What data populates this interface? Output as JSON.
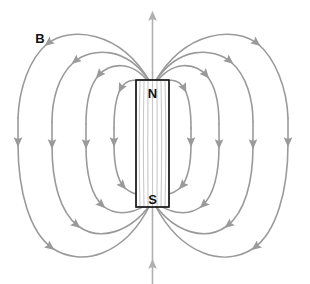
{
  "diagram": {
    "type": "physics-field-line-diagram",
    "background_color": "#ffffff",
    "field_line_color": "#9a9a9a",
    "inner_line_color": "#c9c9c9",
    "magnet_stroke_color": "#1a1a1a",
    "magnet_fill_color": "#ffffff",
    "label_color": "#111111",
    "labels": {
      "field_symbol": "B",
      "north_pole": "N",
      "south_pole": "S"
    },
    "magnet": {
      "x": 136,
      "y": 80,
      "width": 33,
      "height": 127,
      "north_label_y": 93,
      "south_label_y": 200
    },
    "axis": {
      "x": 152.5,
      "top_y": 8,
      "bottom_y": 276,
      "arrow_direction": "up",
      "arrow_count": 2
    },
    "loops": [
      {
        "name": "loop-1-innermost",
        "half_width": 38,
        "half_height": 46
      },
      {
        "name": "loop-2",
        "half_width": 66,
        "half_height": 72
      },
      {
        "name": "loop-3",
        "half_width": 100,
        "half_height": 97
      },
      {
        "name": "loop-4-outermost",
        "half_width": 134,
        "half_height": 116
      }
    ],
    "interior_lines": [
      {
        "offset": -12.5
      },
      {
        "offset": -8.5
      },
      {
        "offset": -4.5
      },
      {
        "offset": 0
      },
      {
        "offset": 4.5
      },
      {
        "offset": 8.5
      },
      {
        "offset": 12.5
      }
    ],
    "flow_description": "Field lines emerge from the N pole at top, arc outward and downward on both sides, and re-enter at the S pole at the bottom."
  }
}
